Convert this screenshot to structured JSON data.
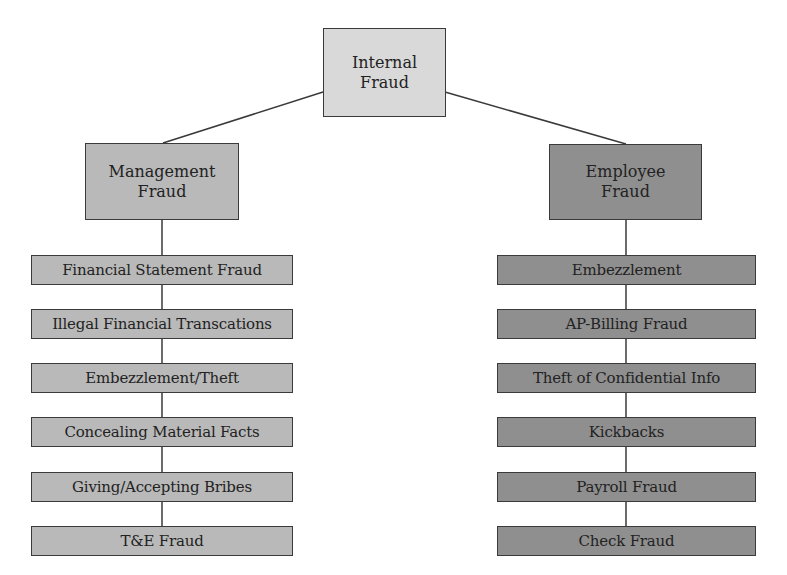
{
  "diagram": {
    "type": "hierarchy",
    "root": {
      "line1": "Internal",
      "line2": "Fraud",
      "fill": "#d9d9d9"
    },
    "branches": [
      {
        "line1": "Management",
        "line2": "Fraud",
        "fill": "#b9b9b9",
        "items": [
          "Financial Statement Fraud",
          "Illegal Financial Transcations",
          "Embezzlement/Theft",
          "Concealing Material Facts",
          "Giving/Accepting Bribes",
          "T&E Fraud"
        ]
      },
      {
        "line1": "Employee",
        "line2": "Fraud",
        "fill": "#8f8f8f",
        "items": [
          "Embezzlement",
          "AP-Billing Fraud",
          "Theft of Confidential Info",
          "Kickbacks",
          "Payroll Fraud",
          "Check Fraud"
        ]
      }
    ],
    "colors": {
      "border": "#3a3a3a",
      "line": "#3a3a3a",
      "text": "#222222"
    }
  }
}
